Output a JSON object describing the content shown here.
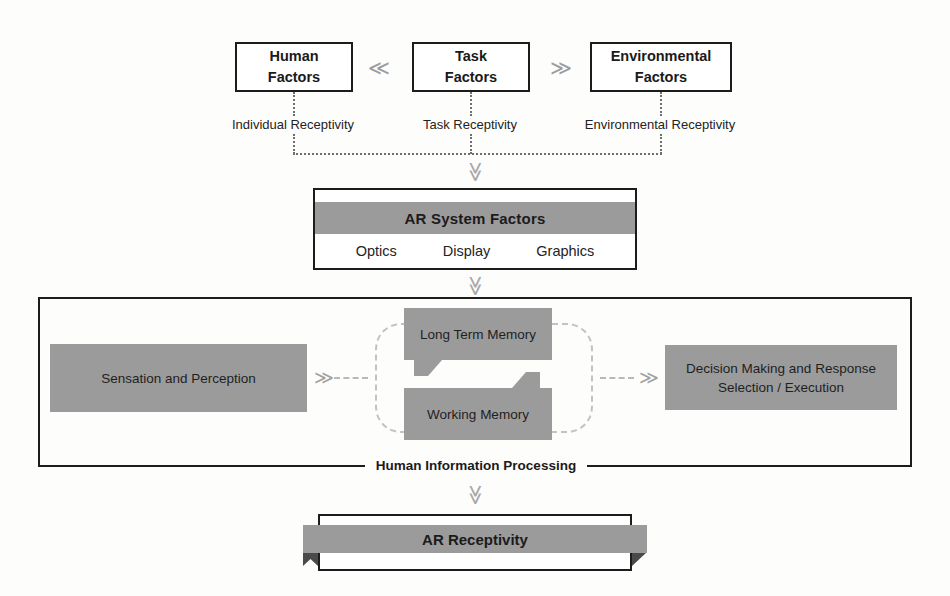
{
  "diagram": {
    "colors": {
      "grey_fill": "#9b9b9b",
      "outline": "#1c1c1c",
      "dotted": "#6e6e6e",
      "dashed_ring": "#c2c2c2",
      "chevron": "#a0a0a0",
      "background": "#fdfdfc"
    }
  },
  "top_row": {
    "boxes": [
      {
        "line1": "Human",
        "line2": "Factors",
        "caption": "Individual Receptivity"
      },
      {
        "line1": "Task",
        "line2": "Factors",
        "caption": "Task Receptivity"
      },
      {
        "line1": "Environmental",
        "line2": "Factors",
        "caption": "Environmental Receptivity"
      }
    ],
    "connector_left": "≪",
    "connector_right": "≫"
  },
  "flow_arrows": {
    "to_ar_system": "≫",
    "to_hip": "≫",
    "to_receptivity": "≫"
  },
  "ar_system": {
    "heading": "AR System Factors",
    "subitems": [
      "Optics",
      "Display",
      "Graphics"
    ]
  },
  "hip": {
    "frame_label": "Human Information Processing",
    "sensation_block": "Sensation and Perception",
    "memory": {
      "long_term": "Long Term Memory",
      "working": "Working Memory"
    },
    "decision_block_line1": "Decision Making and Response",
    "decision_block_line2": "Selection / Execution",
    "arrow_left": "≫",
    "arrow_right": "≫"
  },
  "ar_receptivity": {
    "label": "AR Receptivity"
  }
}
